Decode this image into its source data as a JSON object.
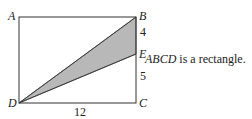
{
  "figure": {
    "vertices": {
      "A": {
        "label": "A",
        "x": 19,
        "y": 17
      },
      "B": {
        "label": "B",
        "x": 136,
        "y": 17
      },
      "C": {
        "label": "C",
        "x": 136,
        "y": 103
      },
      "D": {
        "label": "D",
        "x": 19,
        "y": 103
      },
      "E": {
        "label": "E",
        "x": 136,
        "y": 54
      }
    },
    "measurements": {
      "BE": "4",
      "EC": "5",
      "DC": "12"
    },
    "shaded_region": "triangle DBE",
    "colors": {
      "stroke": "#333333",
      "shade": "#b8b8b8"
    }
  },
  "caption": {
    "subject": "ABCD",
    "text": " is a rectangle."
  }
}
